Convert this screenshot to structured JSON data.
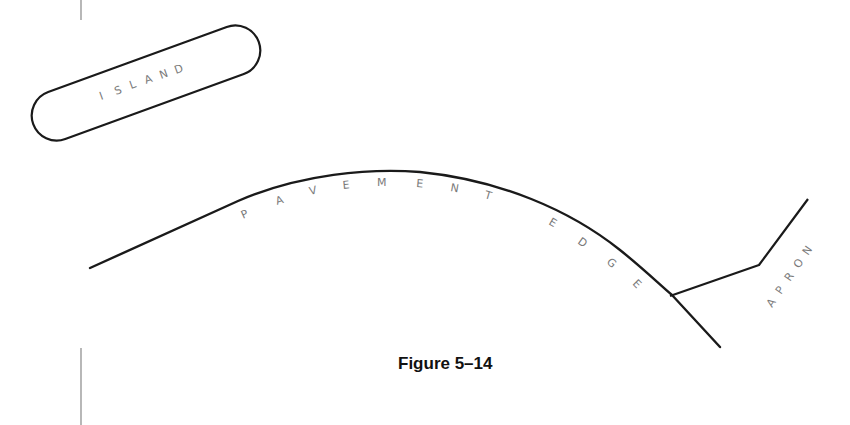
{
  "diagram": {
    "labels": {
      "island": [
        "I",
        "S",
        "L",
        "A",
        "N",
        "D"
      ],
      "pavement_edge": [
        "P",
        "A",
        "V",
        "E",
        "M",
        "E",
        "N",
        "T",
        "E",
        "D",
        "G",
        "E"
      ],
      "apron": [
        "A",
        "P",
        "R",
        "O",
        "N"
      ]
    },
    "caption": "Figure 5–14",
    "colors": {
      "stroke": "#1a1a1a",
      "label": "#7a7a7a",
      "margin_line": "#888888"
    }
  }
}
